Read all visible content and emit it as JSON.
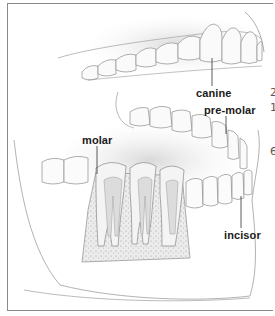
{
  "figure": {
    "labels": {
      "canine": "canine",
      "pre_molar": "pre-molar",
      "molar": "molar",
      "incisor": "incisor"
    },
    "edge_fragments": [
      "2",
      "1",
      "6"
    ]
  },
  "colors": {
    "line": "#8a8a8a",
    "label_text": "#1a1a1a",
    "bone_fill": "#e4e4e4",
    "pulp_fill": "#d2d2d2",
    "gum_shade": "#d9d9d9"
  }
}
